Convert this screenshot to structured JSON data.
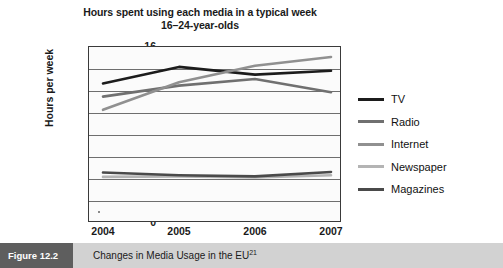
{
  "chart_data": {
    "type": "line",
    "title": "Hours spent using each media in a typical week",
    "subtitle": "16–24-year-olds",
    "xlabel": "",
    "ylabel": "Hours per week",
    "categories": [
      "2004",
      "2005",
      "2006",
      "2007"
    ],
    "x": [
      2004,
      2005,
      2006,
      2007
    ],
    "ylim": [
      0,
      16
    ],
    "ytick_labels": [
      "0",
      "2",
      "4",
      "6",
      "8",
      "10",
      "12",
      "14",
      "16"
    ],
    "ytick_values": [
      0,
      2,
      4,
      6,
      8,
      10,
      12,
      14,
      16
    ],
    "grid": true,
    "legend_position": "right",
    "series": [
      {
        "name": "TV",
        "values": [
          12.6,
          14.1,
          13.4,
          13.75
        ],
        "color": "#1c1c1c"
      },
      {
        "name": "Radio",
        "values": [
          11.4,
          12.4,
          13.0,
          11.8
        ],
        "color": "#707070"
      },
      {
        "name": "Internet",
        "values": [
          10.2,
          12.7,
          14.2,
          15.0
        ],
        "color": "#909090"
      },
      {
        "name": "Newspaper",
        "values": [
          4.1,
          4.15,
          4.05,
          4.25
        ],
        "color": "#b4b4b4"
      },
      {
        "name": "Magazines",
        "values": [
          4.5,
          4.25,
          4.15,
          4.55
        ],
        "color": "#4a4a4a"
      }
    ]
  },
  "caption": {
    "tag": "Figure 12.2",
    "text": "Changes in Media Usage in the EU",
    "superscript": "21"
  },
  "colors": {
    "frame": "#3a3a3a",
    "gridline": "#6e6e6e",
    "caption_tag_bg": "#5e5e5e",
    "caption_bar_bg": "#d2d2d2",
    "plot_bg": "#fbfbfb"
  }
}
